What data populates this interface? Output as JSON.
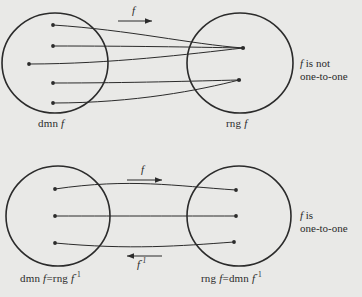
{
  "figure": {
    "background_color": "#e9e9e7",
    "ink_color": "#2b2b2b",
    "panels": [
      {
        "id": "panel-not-one-to-one",
        "domain_label": "dmn f",
        "range_label": "rng f",
        "map_arrow_label": "f",
        "inverse_arrow_label": null,
        "note_line1": "f is not",
        "note_line2": "one-to-one",
        "domain_points": 5,
        "range_points": 2,
        "mappings": "3 domain points map to the upper range point; 2 domain points map to the lower range point"
      },
      {
        "id": "panel-one-to-one",
        "domain_label": "dmn f=rng f",
        "domain_label_sup": "-1",
        "range_label": "rng f=dmn f",
        "range_label_sup": "-1",
        "map_arrow_label": "f",
        "inverse_arrow_label": "f",
        "inverse_arrow_label_sup": "-1",
        "note_line1": "f is",
        "note_line2": "one-to-one",
        "domain_points": 3,
        "range_points": 3,
        "mappings": "each domain point maps to exactly one distinct range point"
      }
    ]
  },
  "chart_data": {
    "type": "diagram",
    "title": "",
    "subtype": "function-mapping-venn",
    "panels": [
      {
        "name": "f is not one-to-one",
        "left_set": "dmn f",
        "right_set": "rng f",
        "left_nodes": [
          "a1",
          "a2",
          "a3",
          "a4",
          "a5"
        ],
        "right_nodes": [
          "b1",
          "b2"
        ],
        "edges": [
          [
            "a1",
            "b1"
          ],
          [
            "a2",
            "b1"
          ],
          [
            "a3",
            "b1"
          ],
          [
            "a4",
            "b2"
          ],
          [
            "a5",
            "b2"
          ]
        ],
        "arrows": [
          {
            "label": "f",
            "direction": "right"
          }
        ]
      },
      {
        "name": "f is one-to-one",
        "left_set": "dmn f = rng f^-1",
        "right_set": "rng f = dmn f^-1",
        "left_nodes": [
          "a1",
          "a2",
          "a3"
        ],
        "right_nodes": [
          "b1",
          "b2",
          "b3"
        ],
        "edges": [
          [
            "a1",
            "b1"
          ],
          [
            "a2",
            "b2"
          ],
          [
            "a3",
            "b3"
          ]
        ],
        "arrows": [
          {
            "label": "f",
            "direction": "right"
          },
          {
            "label": "f^-1",
            "direction": "left"
          }
        ]
      }
    ]
  }
}
